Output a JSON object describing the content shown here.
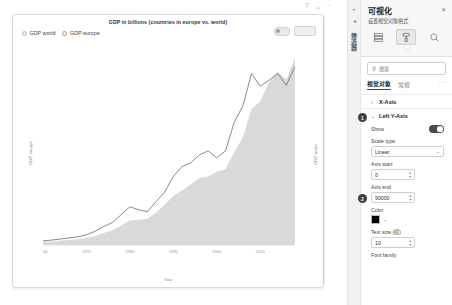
{
  "report": {
    "chart_title": "GDP in billions (countries in europe vs. world)",
    "legend": [
      {
        "label": "GDP world",
        "marker": "filled-circle-marker",
        "color": "#e6e6e6"
      },
      {
        "label": "GDP europe",
        "marker": "open-circle-marker",
        "color": "#9a9a9a"
      }
    ],
    "tools": {
      "filter_icon": "filter-icon",
      "focus_icon": "focus-mode-icon",
      "more_icon": "more-options-icon",
      "toggle_pill": "visual-toggle",
      "focus_pill": "focus-button"
    }
  },
  "chart_data": {
    "type": "area",
    "title": "GDP in billions (countries in europe vs. world)",
    "xlabel": "Year",
    "ylabel": "GDP europe",
    "y2label": "GDP world",
    "xlim": [
      1960,
      2018
    ],
    "ylim": [
      0,
      20000
    ],
    "y2lim": [
      0,
      90000
    ],
    "grid": false,
    "legend_position": "top-left",
    "x_ticks": [
      "1960",
      "1970",
      "1980",
      "1990",
      "2000",
      "2010"
    ],
    "y_left_ticks": [
      "0K",
      "2K",
      "4K",
      "6K",
      "8K",
      "10K",
      "12K",
      "14K",
      "16K",
      "18K",
      "20K"
    ],
    "y_right_ticks": [
      "0K",
      "9K",
      "18K",
      "27K",
      "36K",
      "45K",
      "54K",
      "63K",
      "72K",
      "81K",
      "90K"
    ],
    "x": [
      1960,
      1962,
      1964,
      1966,
      1968,
      1970,
      1972,
      1974,
      1976,
      1978,
      1980,
      1982,
      1984,
      1986,
      1988,
      1990,
      1992,
      1994,
      1996,
      1998,
      2000,
      2002,
      2004,
      2006,
      2008,
      2010,
      2012,
      2014,
      2016,
      2018
    ],
    "series": [
      {
        "name": "GDP world",
        "kind": "area",
        "axis": "right",
        "color": "#d9d9d9",
        "values": [
          1400,
          1600,
          1900,
          2250,
          2600,
          3300,
          4100,
          5500,
          6800,
          9000,
          11200,
          11600,
          12000,
          14800,
          18500,
          22500,
          25000,
          27800,
          30800,
          31500,
          33600,
          34800,
          42500,
          49500,
          62500,
          66000,
          74500,
          79500,
          76000,
          86000
        ]
      },
      {
        "name": "GDP europe",
        "kind": "line",
        "axis": "left",
        "color": "#6b6b6b",
        "values": [
          420,
          500,
          610,
          720,
          830,
          1050,
          1400,
          1900,
          2300,
          3100,
          3900,
          3600,
          3400,
          4400,
          5400,
          7000,
          8000,
          8400,
          9200,
          9600,
          8900,
          9600,
          12500,
          14200,
          17500,
          16200,
          16800,
          17500,
          16300,
          18200
        ]
      }
    ]
  },
  "panel": {
    "rail": {
      "collapse_icon": "chevron-double-left-icon",
      "filter_icon": "filter-pane-icon",
      "vertical_label": "筛选器"
    },
    "title": "可视化",
    "subtitle": "设置视觉对象格式",
    "close_label": "✕",
    "format_tabs": [
      {
        "name": "build-visual-tab",
        "icon": "card-table-icon",
        "active": false
      },
      {
        "name": "format-visual-tab",
        "icon": "paint-roller-icon",
        "active": true
      },
      {
        "name": "analytics-tab",
        "icon": "magnifier-analytics-icon",
        "active": false
      }
    ],
    "search": {
      "placeholder": "搜索",
      "value": "",
      "icon": "search-icon"
    },
    "object_tabs": [
      {
        "label": "视觉对象",
        "active": true
      },
      {
        "label": "常规",
        "active": false
      }
    ],
    "more_label": "···",
    "sections": [
      {
        "name": "X-Axis",
        "expanded": false,
        "chevron": "›"
      },
      {
        "name": "Left Y-Axis",
        "expanded": true,
        "chevron": "⌄",
        "badge": "1"
      }
    ],
    "fields": {
      "show_label": "Show",
      "show_value": "on",
      "scale_type_label": "Scale type",
      "scale_type_value": "Linear",
      "axis_start_label": "Axis start",
      "axis_start_value": "0",
      "axis_end_label": "Axis end",
      "axis_end_value": "90000",
      "axis_end_badge": "2",
      "color_label": "Color",
      "color_value": "#000000",
      "text_size_label": "Text size (磅)",
      "text_size_value": "10",
      "font_family_label": "Font family"
    }
  }
}
